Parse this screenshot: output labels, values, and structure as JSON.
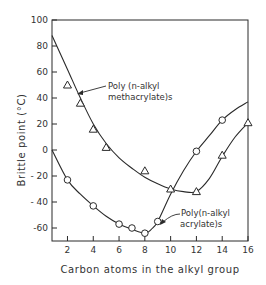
{
  "chart_data": {
    "type": "scatter",
    "title": "",
    "xlabel": "Carbon atoms in the alkyl group",
    "ylabel": "Brittle point (°C)",
    "xlim": [
      0.8,
      16
    ],
    "ylim": [
      -70,
      100
    ],
    "xticks": [
      2,
      4,
      6,
      8,
      10,
      12,
      14,
      16
    ],
    "yticks": [
      100,
      80,
      60,
      40,
      20,
      0,
      -20,
      -40,
      -60
    ],
    "ytick_labels": [
      "100",
      "80",
      "60",
      "40",
      "20",
      "0",
      "- 20",
      "- 40",
      "-60"
    ],
    "grid": false,
    "series": [
      {
        "name": "Poly(n-alkyl methacrylate)s",
        "marker": "triangle",
        "x": [
          2,
          3,
          4,
          5,
          8,
          10,
          12,
          14,
          16
        ],
        "y": [
          50,
          36,
          16,
          2,
          -16,
          -30,
          -32,
          -4,
          21
        ],
        "curve": [
          [
            0.8,
            88
          ],
          [
            2,
            62
          ],
          [
            3,
            40
          ],
          [
            4,
            20
          ],
          [
            5,
            5
          ],
          [
            6,
            -6
          ],
          [
            7,
            -14
          ],
          [
            8,
            -21
          ],
          [
            9,
            -26
          ],
          [
            10,
            -30
          ],
          [
            11,
            -32
          ],
          [
            12,
            -32
          ],
          [
            13,
            -22
          ],
          [
            14,
            -5
          ],
          [
            15,
            10
          ],
          [
            16,
            21
          ]
        ]
      },
      {
        "name": "Poly(n-alkyl acrylate)s",
        "marker": "circle",
        "x": [
          2,
          4,
          6,
          7,
          8,
          9,
          12,
          14
        ],
        "y": [
          -23,
          -43,
          -57,
          -60,
          -64,
          -55,
          -1,
          23
        ],
        "curve": [
          [
            0.8,
            0
          ],
          [
            2,
            -23
          ],
          [
            3,
            -34
          ],
          [
            4,
            -43
          ],
          [
            5,
            -51
          ],
          [
            6,
            -57
          ],
          [
            7,
            -61
          ],
          [
            8,
            -64
          ],
          [
            8.5,
            -61
          ],
          [
            9,
            -55
          ],
          [
            10,
            -34
          ],
          [
            11,
            -16
          ],
          [
            12,
            -1
          ],
          [
            13,
            11
          ],
          [
            14,
            23
          ],
          [
            15,
            31
          ],
          [
            16,
            37
          ]
        ]
      }
    ],
    "annotations": [
      {
        "text_lines": [
          "Poly (n-alkyl",
          "methacrylate)s"
        ],
        "points_to_series": 0
      },
      {
        "text_lines": [
          "Poly(n-alkyl",
          "acrylate)s"
        ],
        "points_to_series": 1
      }
    ]
  },
  "labels": {
    "xlabel": "Carbon atoms in the alkyl group",
    "ylabel": "Brittle point (°C)",
    "annot_meth_1": "Poly (n-alkyl",
    "annot_meth_2": "methacrylate)s",
    "annot_acr_1": "Poly(n-alkyl",
    "annot_acr_2": "acrylate)s"
  },
  "colors": {
    "line": "#2a2a2a",
    "background": "#ffffff"
  }
}
